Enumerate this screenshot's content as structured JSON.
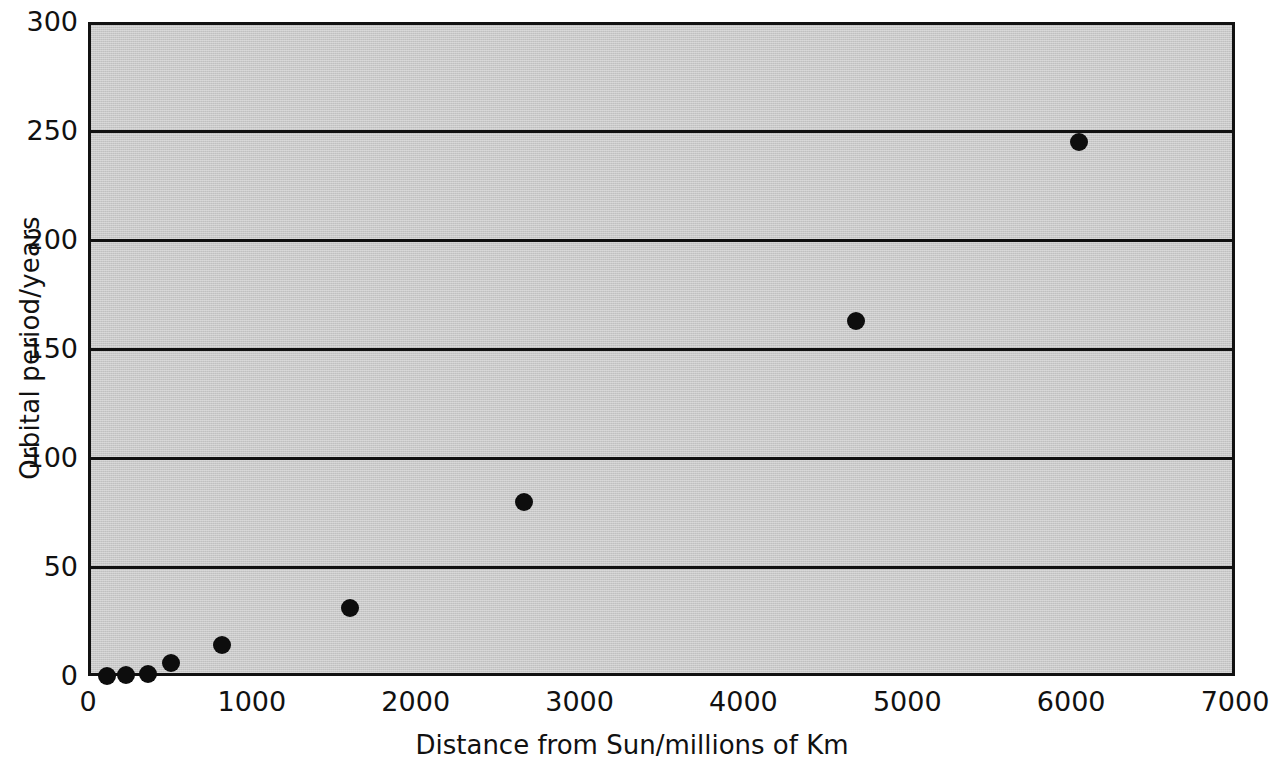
{
  "chart_data": {
    "type": "scatter",
    "title": "",
    "xlabel": "Distance from Sun/millions of Km",
    "ylabel": "Orbital period/years",
    "xlim": [
      0,
      7000
    ],
    "ylim": [
      0,
      300
    ],
    "xticks": [
      "0",
      "1000",
      "2000",
      "3000",
      "4000",
      "5000",
      "6000",
      "7000"
    ],
    "xtick_values": [
      0,
      1000,
      2000,
      3000,
      4000,
      5000,
      6000,
      7000
    ],
    "yticks": [
      "0",
      "50",
      "100",
      "150",
      "200",
      "250",
      "300"
    ],
    "ytick_values": [
      0,
      50,
      100,
      150,
      200,
      250,
      300
    ],
    "grid": "horizontal",
    "legend": "none",
    "marker": "filled-circle",
    "marker_color": "#0d0d0d",
    "plot_background": "#c9c9c9",
    "axis_color": "#111111",
    "points": [
      {
        "x": 100,
        "y": 0.2
      },
      {
        "x": 215,
        "y": 0.6
      },
      {
        "x": 345,
        "y": 1.0
      },
      {
        "x": 490,
        "y": 6.0
      },
      {
        "x": 800,
        "y": 14.0
      },
      {
        "x": 1580,
        "y": 31.0
      },
      {
        "x": 2640,
        "y": 80.0
      },
      {
        "x": 4670,
        "y": 163.0
      },
      {
        "x": 6030,
        "y": 245.0
      }
    ]
  },
  "figure": {
    "background": "#ffffff"
  }
}
